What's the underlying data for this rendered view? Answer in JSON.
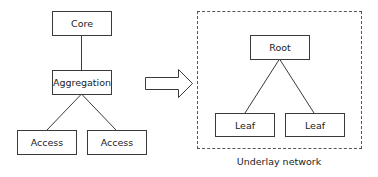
{
  "left_topology": {
    "core": {
      "label": "Core"
    },
    "aggregation": {
      "label": "Aggregation"
    },
    "access": [
      {
        "label": "Access"
      },
      {
        "label": "Access"
      }
    ]
  },
  "transition_arrow": {
    "icon": "right-block-arrow-icon"
  },
  "right_topology": {
    "group_caption": "Underlay network",
    "root": {
      "label": "Root"
    },
    "leaves": [
      {
        "label": "Leaf"
      },
      {
        "label": "Leaf"
      }
    ]
  },
  "colors": {
    "stroke": "#3a3a3a",
    "text": "#222222",
    "background": "#ffffff"
  }
}
